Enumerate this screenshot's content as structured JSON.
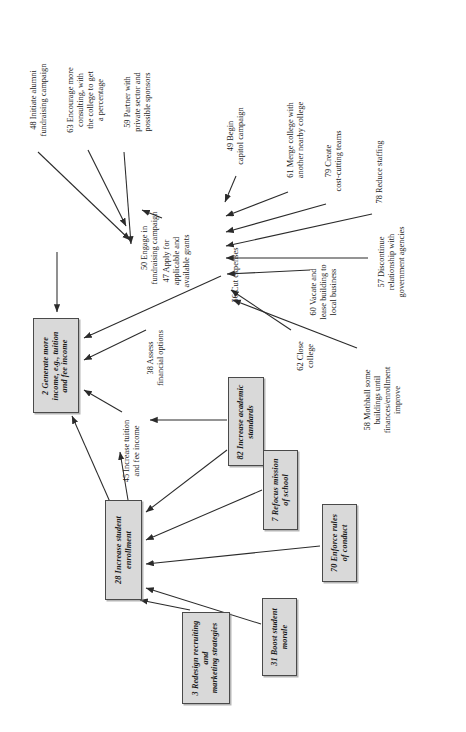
{
  "diagram": {
    "orientation": "rotated-90-ccw",
    "style": {
      "box_fill": "#d9d9d9",
      "box_border": "#4a4a4a",
      "edge_color": "#2b2b2b",
      "background": "#ffffff"
    },
    "box_nodes": [
      {
        "id": "2",
        "label": "2 Generate more\nincome, e.g., tuition\nand fee income",
        "x": 33,
        "y": 318,
        "w": 46,
        "h": 95
      },
      {
        "id": "28",
        "label": "28 Increase student\nenrollment",
        "x": 105,
        "y": 500,
        "w": 37,
        "h": 100
      },
      {
        "id": "82",
        "label": "82 Increase academic\nstandards",
        "x": 228,
        "y": 377,
        "w": 36,
        "h": 89
      },
      {
        "id": "7",
        "label": "7 Refocus mission\nof school",
        "x": 263,
        "y": 450,
        "w": 35,
        "h": 80
      },
      {
        "id": "70",
        "label": "70 Enforce rules\nof conduct",
        "x": 322,
        "y": 504,
        "w": 35,
        "h": 78
      },
      {
        "id": "31",
        "label": "31 Boost student\nmorale",
        "x": 262,
        "y": 598,
        "w": 35,
        "h": 78
      },
      {
        "id": "3",
        "label": "3 Redesign recruiting\nand\nmarketing strategies",
        "x": 182,
        "y": 612,
        "w": 48,
        "h": 92
      }
    ],
    "text_nodes": [
      {
        "id": "48",
        "label": "48 Initiate alumni\nfundraising campaign",
        "x": 22,
        "y": 50,
        "w": 34,
        "h": 100
      },
      {
        "id": "63",
        "label": "63 Encourage more\nconsulting, with\nthe college to get\na percentage",
        "x": 62,
        "y": 52,
        "w": 48,
        "h": 96
      },
      {
        "id": "59",
        "label": "59 Partner with\nprivate sector and\npossible sponsors",
        "x": 118,
        "y": 54,
        "w": 40,
        "h": 96
      },
      {
        "id": "50",
        "label": "50 Engage in\nfundraising campaign",
        "x": 136,
        "y": 196,
        "w": 27,
        "h": 104
      },
      {
        "id": "47",
        "label": "47 Apply for\napplicable and\navailable grants",
        "x": 158,
        "y": 222,
        "w": 38,
        "h": 78
      },
      {
        "id": "49",
        "label": "49 Begin\ncapitol campaign",
        "x": 222,
        "y": 96,
        "w": 28,
        "h": 80
      },
      {
        "id": "61",
        "label": "61 Merge college with\nanother nearby college",
        "x": 282,
        "y": 88,
        "w": 28,
        "h": 104
      },
      {
        "id": "79",
        "label": "79 Create\ncost-cutting teams",
        "x": 320,
        "y": 118,
        "w": 28,
        "h": 86
      },
      {
        "id": "78",
        "label": "78 Reduce staffing",
        "x": 372,
        "y": 130,
        "w": 15,
        "h": 84
      },
      {
        "id": "56",
        "label": "56 Cut expenses",
        "x": 228,
        "y": 234,
        "w": 15,
        "h": 82
      },
      {
        "id": "57",
        "label": "57 Discontinue\nrelationship with\ngovernment agencies",
        "x": 372,
        "y": 210,
        "w": 40,
        "h": 104
      },
      {
        "id": "60",
        "label": "60 Vacate and\nlease building to\nlocal business",
        "x": 304,
        "y": 250,
        "w": 40,
        "h": 84
      },
      {
        "id": "38",
        "label": "38 Assess\nfinancial options",
        "x": 142,
        "y": 318,
        "w": 28,
        "h": 80
      },
      {
        "id": "62",
        "label": "62 Close\ncollege",
        "x": 292,
        "y": 330,
        "w": 28,
        "h": 52
      },
      {
        "id": "58",
        "label": "58 Mothball some\nbuildings until\nfinances/enrollment\nimprove",
        "x": 358,
        "y": 348,
        "w": 50,
        "h": 104
      },
      {
        "id": "45",
        "label": "45 Increase tuition\nand fee income",
        "x": 118,
        "y": 406,
        "w": 28,
        "h": 90
      }
    ],
    "edges": [
      {
        "from": "48",
        "to": "50"
      },
      {
        "from": "63",
        "to": "50"
      },
      {
        "from": "59",
        "to": "50"
      },
      {
        "from": "47",
        "to": "50"
      },
      {
        "from": "50",
        "to": "2"
      },
      {
        "from": "49",
        "to": "56"
      },
      {
        "from": "61",
        "to": "56"
      },
      {
        "from": "79",
        "to": "56"
      },
      {
        "from": "78",
        "to": "56"
      },
      {
        "from": "57",
        "to": "56"
      },
      {
        "from": "60",
        "to": "56"
      },
      {
        "from": "62",
        "to": "56"
      },
      {
        "from": "58",
        "to": "56"
      },
      {
        "from": "56",
        "to": "2"
      },
      {
        "from": "38",
        "to": "2"
      },
      {
        "from": "45",
        "to": "2"
      },
      {
        "from": "28",
        "to": "45"
      },
      {
        "from": "28",
        "to": "2"
      },
      {
        "from": "82",
        "to": "45"
      },
      {
        "from": "82",
        "to": "28"
      },
      {
        "from": "7",
        "to": "82"
      },
      {
        "from": "7",
        "to": "28"
      },
      {
        "from": "70",
        "to": "28"
      },
      {
        "from": "31",
        "to": "28"
      },
      {
        "from": "3",
        "to": "28"
      }
    ]
  }
}
